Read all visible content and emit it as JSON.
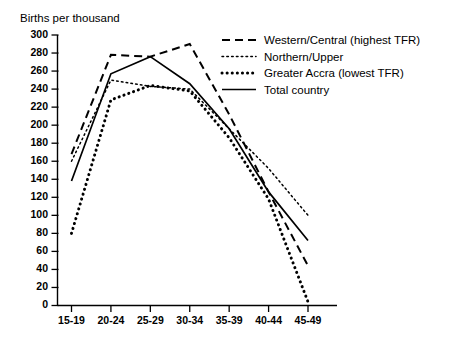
{
  "chart_data": {
    "type": "line",
    "title": "Births per thousand",
    "xlabel": "",
    "ylabel": "",
    "categories": [
      "15-19",
      "20-24",
      "25-29",
      "30-34",
      "35-39",
      "40-44",
      "45-49"
    ],
    "ylim": [
      0,
      300
    ],
    "ytick_step": 20,
    "yticks": [
      0,
      20,
      40,
      60,
      80,
      100,
      120,
      140,
      160,
      180,
      200,
      220,
      240,
      260,
      280,
      300
    ],
    "grid": false,
    "legend_position": "top-right",
    "series": [
      {
        "name": "Western/Central (highest TFR)",
        "style": "dashed",
        "values": [
          168,
          278,
          276,
          290,
          212,
          126,
          44
        ]
      },
      {
        "name": "Northern/Upper",
        "style": "dotted-fine",
        "values": [
          160,
          250,
          243,
          240,
          196,
          152,
          100
        ]
      },
      {
        "name": "Greater Accra (lowest TFR)",
        "style": "dotted-bold",
        "values": [
          80,
          228,
          244,
          238,
          186,
          118,
          4
        ]
      },
      {
        "name": "Total country",
        "style": "solid",
        "values": [
          138,
          257,
          276,
          246,
          196,
          126,
          72
        ]
      }
    ]
  },
  "axis": {
    "y_tick_labels": [
      "300",
      "280",
      "260",
      "240",
      "220",
      "200",
      "180",
      "160",
      "140",
      "120",
      "100",
      "80",
      "60",
      "40",
      "20",
      "0"
    ],
    "x_tick_labels": [
      "15-19",
      "20-24",
      "25-29",
      "30-34",
      "35-39",
      "40-44",
      "45-49"
    ]
  },
  "legend": {
    "items": [
      {
        "label": "Western/Central (highest TFR)",
        "style": "dashed"
      },
      {
        "label": "Northern/Upper",
        "style": "dotted-fine"
      },
      {
        "label": "Greater Accra (lowest TFR)",
        "style": "dotted-bold"
      },
      {
        "label": "Total country",
        "style": "solid"
      }
    ]
  }
}
